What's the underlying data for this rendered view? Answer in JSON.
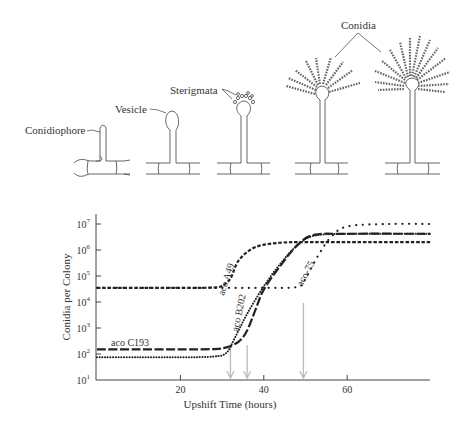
{
  "illustration": {
    "labels": {
      "conidiophore": "Conidiophore",
      "vesicle": "Vesicle",
      "sterigmata": "Sterigmata",
      "conidia": "Conidia"
    }
  },
  "chart_data": {
    "type": "line",
    "title": "",
    "xlabel": "Upshift Time (hours)",
    "ylabel": "Conidia per Colony",
    "yscale": "log",
    "xlim": [
      0,
      80
    ],
    "ylim": [
      10,
      30000000
    ],
    "x_ticks": [
      20,
      40,
      60
    ],
    "x_tick_labels": [
      "20",
      "40",
      "60"
    ],
    "y_ticks": [
      10,
      100,
      1000,
      10000,
      100000,
      1000000,
      10000000
    ],
    "y_tick_labels": [
      "10^1",
      "10^2",
      "10^3",
      "10^4",
      "10^5",
      "10^6",
      "10^7"
    ],
    "y_tick_base": "10",
    "y_tick_exps": [
      "1",
      "2",
      "3",
      "4",
      "5",
      "6",
      "7"
    ],
    "grid": false,
    "legend": "inline labels",
    "series": [
      {
        "name": "aco A49",
        "style": "short-dash",
        "x": [
          0,
          10,
          20,
          28,
          30,
          32,
          34,
          38,
          44,
          50,
          60,
          80
        ],
        "y": [
          35000,
          35000,
          35000,
          36000,
          42000,
          80000,
          400000,
          1300000,
          1900000,
          2000000,
          2000000,
          2000000
        ]
      },
      {
        "name": "aco B202",
        "style": "dotted",
        "x": [
          0,
          10,
          20,
          28,
          31,
          33,
          36,
          40,
          44,
          48,
          52,
          60,
          80
        ],
        "y": [
          75,
          75,
          75,
          80,
          110,
          400,
          3500,
          40000,
          300000,
          1500000,
          3500000,
          4200000,
          4200000
        ]
      },
      {
        "name": "aco C193",
        "style": "long-dash",
        "x": [
          0,
          10,
          20,
          28,
          31,
          34,
          36,
          38,
          40,
          44,
          48,
          52,
          60,
          80
        ],
        "y": [
          150,
          150,
          150,
          155,
          180,
          300,
          800,
          5000,
          30000,
          250000,
          1500000,
          3800000,
          4200000,
          4200000
        ]
      },
      {
        "name": "aco-75",
        "style": "sparse-dotted",
        "x": [
          0,
          10,
          20,
          30,
          40,
          48,
          50,
          53,
          56,
          60,
          70,
          80
        ],
        "y": [
          35000,
          35000,
          35000,
          35000,
          35000,
          38000,
          80000,
          600000,
          3000000,
          8000000,
          10000000,
          10000000
        ]
      }
    ],
    "annotations": [
      {
        "type": "arrow",
        "x": 32,
        "label": "aco A49 / aco C193 onset"
      },
      {
        "type": "arrow",
        "x": 36,
        "label": "aco B202 onset"
      },
      {
        "type": "arrow",
        "x": 49.5,
        "label": "aco-75 onset"
      }
    ]
  }
}
